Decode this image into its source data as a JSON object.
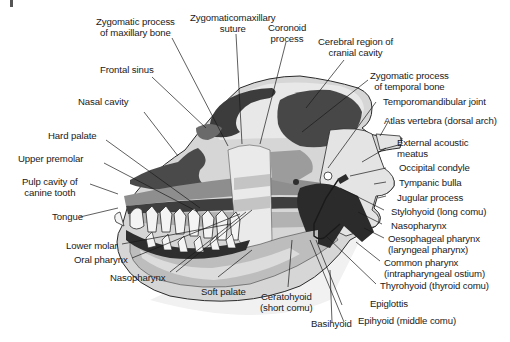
{
  "diagram": {
    "colors": {
      "dark": "#3a3a3a",
      "mid_dark": "#6e6e6e",
      "mid": "#9a9a9a",
      "light": "#c8c8c8",
      "lighter": "#e2e2e2",
      "outline": "#2a2a2a"
    },
    "labels": {
      "zyg_max": "Zygomatic process\nof maxillary bone",
      "zyg_suture": "Zygomaticomaxillary\nsuture",
      "coronoid": "Coronoid\nprocess",
      "cerebral": "Cerebral region of\ncranial cavity",
      "frontal_sinus": "Frontal sinus",
      "nasal_cavity": "Nasal cavity",
      "zyg_temp": "Zygomatic process\nof temporal bone",
      "tmj": "Temporomandibular joint",
      "atlas": "Atlas vertebra (dorsal arch)",
      "ext_acoustic": "External acoustic\nmeatus",
      "hard_palate": "Hard palate",
      "upper_premolar": "Upper premolar",
      "occipital": "Occipital condyle",
      "pulp_cavity": "Pulp cavity of\ncanine tooth",
      "tympanic": "Tympanic bulla",
      "jugular": "Jugular process",
      "stylohyoid": "Stylohyoid (long comu)",
      "tongue": "Tongue",
      "nasopharynx_r": "Nasopharynx",
      "oesophageal": "Oesophageal pharynx\n(laryngeal pharynx)",
      "lower_molar": "Lower molar",
      "common_pharynx": "Common pharynx\n(intrapharyngeal ostium)",
      "oral_pharynx": "Oral pharynx",
      "thyrohyoid": "Thyrohyoid (thyroid comu)",
      "nasopharynx_b": "Nasopharynx",
      "soft_palate": "Soft palate",
      "ceratohyoid": "Ceratohyoid\n(short comu)",
      "epiglottis": "Epiglottis",
      "epihyoid": "Epihyoid (middle comu)",
      "basihyoid": "Basihyoid"
    }
  }
}
